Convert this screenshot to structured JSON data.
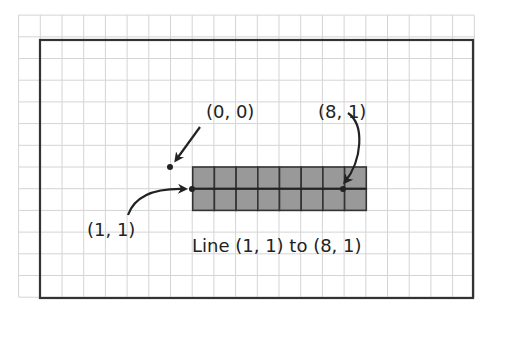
{
  "diagram": {
    "grid": {
      "columns_range": [
        -7,
        14
      ],
      "rows_range": [
        -7,
        6
      ]
    },
    "origin_label": "(0, 0)",
    "start_label": "(1, 1)",
    "end_label": "(8, 1)",
    "caption": "Line (1, 1) to (8, 1)",
    "line": {
      "from": [
        1,
        1
      ],
      "to": [
        8,
        1
      ]
    },
    "filled_pixels": {
      "x_range": [
        1,
        8
      ],
      "y_range": [
        0,
        1
      ]
    },
    "colors": {
      "grid": "#d4d4d4",
      "border": "#333333",
      "pixel_fill": "#999999",
      "pixel_stroke": "#333333",
      "text": "#222222"
    }
  }
}
